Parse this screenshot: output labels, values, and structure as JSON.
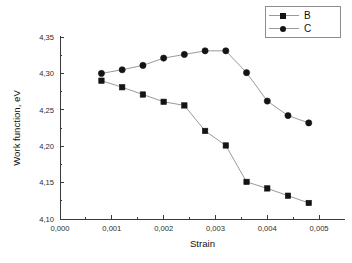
{
  "chart_data": {
    "type": "line",
    "title": "",
    "xlabel": "Strain",
    "ylabel": "Work function, eV",
    "xlim": [
      0.0,
      0.0055
    ],
    "ylim": [
      4.1,
      4.35
    ],
    "grid": false,
    "legend_position": "top-right",
    "decimal_separator": ",",
    "x_ticks": [
      "0,000",
      "0,001",
      "0,002",
      "0,003",
      "0,004",
      "0,005"
    ],
    "x_tick_values": [
      0.0,
      0.001,
      0.002,
      0.003,
      0.004,
      0.005
    ],
    "y_ticks": [
      "4,10",
      "4,15",
      "4,20",
      "4,25",
      "4,30",
      "4,35"
    ],
    "y_tick_values": [
      4.1,
      4.15,
      4.2,
      4.25,
      4.3,
      4.35
    ],
    "x": [
      0.0008,
      0.0012,
      0.0016,
      0.002,
      0.0024,
      0.0028,
      0.0032,
      0.0036,
      0.004,
      0.0044,
      0.0048
    ],
    "series": [
      {
        "name": "B",
        "marker": "square",
        "color": "#141414",
        "line_color": "#9a9a9a",
        "values": [
          4.29,
          4.281,
          4.271,
          4.261,
          4.256,
          4.221,
          4.201,
          4.151,
          4.142,
          4.132,
          4.122
        ]
      },
      {
        "name": "C",
        "marker": "circle",
        "color": "#141414",
        "line_color": "#9a9a9a",
        "values": [
          4.3,
          4.305,
          4.311,
          4.321,
          4.326,
          4.331,
          4.331,
          4.301,
          4.262,
          4.242,
          4.232
        ]
      }
    ]
  },
  "legend": {
    "entries": [
      {
        "label": "B",
        "marker": "square"
      },
      {
        "label": "C",
        "marker": "circle"
      }
    ]
  },
  "axes": {
    "x_title": "Strain",
    "y_title": "Work function, eV"
  }
}
